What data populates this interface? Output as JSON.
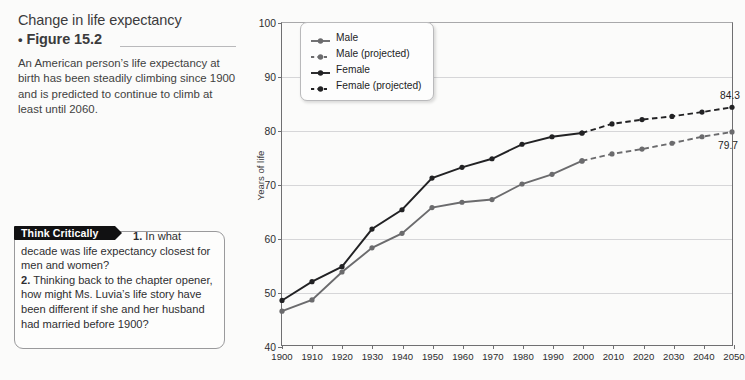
{
  "figure": {
    "title_line1": "Change in life expectancy",
    "title_bullet": "•",
    "title_line2": "Figure 15.2",
    "caption": "An American person’s life expectancy at birth has been steadily climbing since 1900 and is predicted to continue to climb at least until 2060."
  },
  "think_critically": {
    "banner": "Think Critically",
    "q1_number": "1.",
    "q1_text": " In what decade was life expectancy closest for men and women?",
    "q2_number": "2.",
    "q2_text": " Thinking back to the chapter opener, how might Ms. Luvia’s life story have been different if she and her husband had married before 1900?"
  },
  "chart_data": {
    "type": "line",
    "title": "",
    "xlabel": "",
    "ylabel": "Years of life",
    "x": [
      1900,
      1910,
      1920,
      1930,
      1940,
      1950,
      1960,
      1970,
      1980,
      1990,
      2000,
      2010,
      2020,
      2030,
      2040,
      2050
    ],
    "xtick_labels": [
      "1900",
      "1910",
      "1920",
      "1930",
      "1940",
      "1950",
      "1960",
      "1970",
      "1980",
      "1990",
      "2000",
      "2010",
      "2020",
      "2030",
      "2040",
      "2050"
    ],
    "ytick_labels": [
      "40",
      "50",
      "60",
      "70",
      "80",
      "90",
      "100"
    ],
    "yticks": [
      40,
      50,
      60,
      70,
      80,
      90,
      100
    ],
    "ylim": [
      40,
      100
    ],
    "xlim": [
      1900,
      2050
    ],
    "grid": "horizontal",
    "legend_position": "top-left-inside",
    "series": [
      {
        "name": "Male",
        "style": "solid",
        "color": "#6b6b6d",
        "x": [
          1900,
          1910,
          1920,
          1930,
          1940,
          1950,
          1960,
          1970,
          1980,
          1990,
          2000
        ],
        "values": [
          46.3,
          48.4,
          53.6,
          58.1,
          60.8,
          65.6,
          66.6,
          67.1,
          70.0,
          71.8,
          74.3
        ]
      },
      {
        "name": "Male (projected)",
        "style": "dashed",
        "color": "#6b6b6d",
        "x": [
          2000,
          2010,
          2020,
          2030,
          2040,
          2050
        ],
        "values": [
          74.3,
          75.6,
          76.5,
          77.6,
          78.8,
          79.7
        ]
      },
      {
        "name": "Female",
        "style": "solid",
        "color": "#222224",
        "x": [
          1900,
          1910,
          1920,
          1930,
          1940,
          1950,
          1960,
          1970,
          1980,
          1990,
          2000
        ],
        "values": [
          48.3,
          51.8,
          54.6,
          61.6,
          65.2,
          71.1,
          73.1,
          74.7,
          77.4,
          78.8,
          79.5
        ]
      },
      {
        "name": "Female (projected)",
        "style": "dashed",
        "color": "#222224",
        "x": [
          2000,
          2010,
          2020,
          2030,
          2040,
          2050
        ],
        "values": [
          79.5,
          81.2,
          82.0,
          82.6,
          83.4,
          84.3
        ]
      }
    ],
    "annotations": [
      {
        "text": "84.3",
        "x": 2050,
        "y": 84.3,
        "dx": -4,
        "dy": -13,
        "series": "Female (projected)"
      },
      {
        "text": "79.7",
        "x": 2050,
        "y": 79.7,
        "dx": -6,
        "dy": 12,
        "series": "Male (projected)"
      }
    ],
    "legend": [
      {
        "label": "Male",
        "style": "solid",
        "color": "#6b6b6d"
      },
      {
        "label": "Male (projected)",
        "style": "dashed",
        "color": "#6b6b6d"
      },
      {
        "label": "Female",
        "style": "solid",
        "color": "#222224"
      },
      {
        "label": "Female (projected)",
        "style": "dashed",
        "color": "#222224"
      }
    ]
  }
}
